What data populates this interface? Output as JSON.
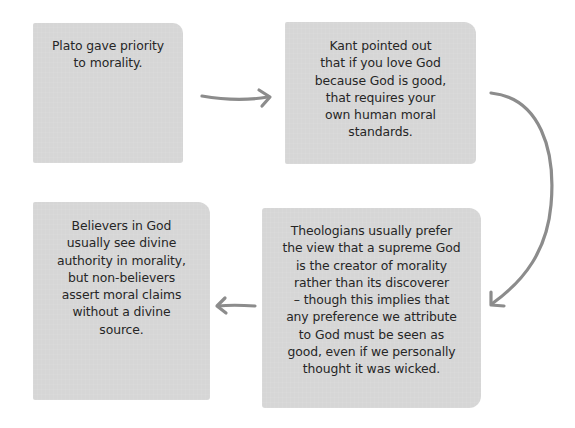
{
  "diagram": {
    "type": "flow",
    "colors": {
      "background": "#ffffff",
      "card_fill": "#d6d6d6",
      "text": "#262626",
      "arrow": "#8c8c8c"
    },
    "cards": [
      {
        "id": "plato",
        "lines": [
          "Plato gave priority",
          "to morality."
        ]
      },
      {
        "id": "kant",
        "lines": [
          "Kant pointed out",
          "that if you love God",
          "because God is good,",
          "that requires your",
          "own human moral",
          "standards."
        ]
      },
      {
        "id": "believers",
        "lines": [
          "Believers in God",
          "usually see divine",
          "authority in morality,",
          "but non-believers",
          "assert moral claims",
          "without a divine",
          "source."
        ]
      },
      {
        "id": "theologians",
        "lines": [
          "Theologians usually prefer",
          "the view that a supreme God",
          "is the creator of morality",
          "rather than its discoverer",
          "– though this implies that",
          "any preference we attribute",
          "to God must be seen as",
          "good, even if we personally",
          "thought it was wicked."
        ]
      }
    ],
    "arrows": [
      {
        "from": "plato",
        "to": "kant",
        "direction": "right"
      },
      {
        "from": "kant",
        "to": "theologians",
        "direction": "curved-down"
      },
      {
        "from": "theologians",
        "to": "believers",
        "direction": "left"
      }
    ]
  }
}
